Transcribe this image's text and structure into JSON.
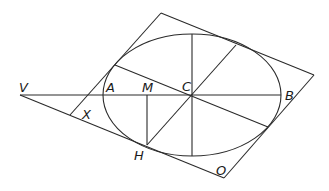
{
  "diagram": {
    "type": "geometry",
    "stroke_color": "#2a2a2a",
    "background": "#ffffff",
    "labels": {
      "V": "V",
      "A": "A",
      "M": "M",
      "C": "C",
      "B": "B",
      "X": "X",
      "H": "H",
      "O": "O"
    }
  }
}
